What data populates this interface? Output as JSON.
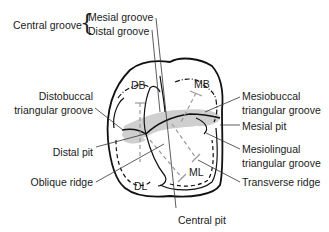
{
  "diagram": {
    "type": "dental occlusal surface diagram (maxillary molar)",
    "cusp_labels": {
      "db": "DB",
      "mb": "MB",
      "dl": "DL",
      "ml": "ML"
    },
    "left_labels": {
      "central_groove": "Central groove",
      "mesial_groove": "Mesial groove",
      "distal_groove": "Distal groove",
      "distobuccal_1": "Distobuccal",
      "distobuccal_2": "triangular groove",
      "distal_pit": "Distal pit",
      "oblique_ridge": "Oblique ridge"
    },
    "right_labels": {
      "mesiobuccal_1": "Mesiobuccal",
      "mesiobuccal_2": "triangular groove",
      "mesial_pit": "Mesial pit",
      "mesiolingual_1": "Mesiolingual",
      "mesiolingual_2": "triangular groove",
      "transverse_ridge": "Transverse ridge"
    },
    "bottom_labels": {
      "central_pit": "Central pit"
    },
    "colors": {
      "outline": "#111111",
      "leader": "#333333",
      "shading": "#c8c8c8",
      "dashed_ridge": "#9a9a9a"
    }
  }
}
